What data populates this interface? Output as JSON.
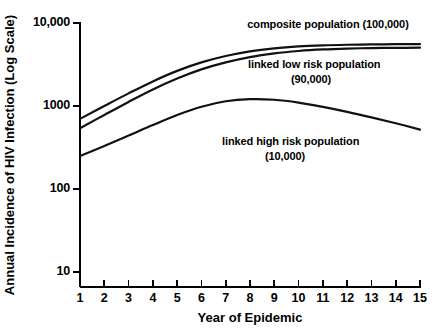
{
  "chart_data": {
    "type": "line",
    "title": "",
    "xlabel": "Year of Epidemic",
    "ylabel": "Annual Incidence of HIV Infection (Log Scale)",
    "xlim": [
      1,
      15
    ],
    "ylim": [
      10,
      10000
    ],
    "yscale": "log",
    "grid": false,
    "legend": "inline-annotations",
    "xticks": [
      "1",
      "2",
      "3",
      "4",
      "5",
      "6",
      "7",
      "8",
      "9",
      "10",
      "11",
      "12",
      "13",
      "14",
      "15"
    ],
    "yticks": [
      "10",
      "100",
      "1000",
      "10,000"
    ],
    "x": [
      1,
      2,
      3,
      4,
      5,
      6,
      7,
      8,
      9,
      10,
      11,
      12,
      13,
      14,
      15
    ],
    "series": [
      {
        "name": "composite population (100,000)",
        "population": "100,000",
        "values": [
          700,
          1000,
          1420,
          1980,
          2650,
          3350,
          4000,
          4550,
          4950,
          5220,
          5380,
          5470,
          5520,
          5550,
          5560
        ]
      },
      {
        "name": "linked low risk population (90,000)",
        "population": "90,000",
        "values": [
          540,
          780,
          1120,
          1580,
          2140,
          2760,
          3350,
          3880,
          4300,
          4600,
          4800,
          4920,
          4990,
          5020,
          5040
        ]
      },
      {
        "name": "linked high risk population (10,000)",
        "population": "10,000",
        "values": [
          250,
          330,
          440,
          590,
          780,
          980,
          1140,
          1210,
          1190,
          1100,
          975,
          850,
          730,
          620,
          520
        ]
      }
    ]
  },
  "annotations": [
    {
      "id": "composite",
      "line1": "composite population (100,000)",
      "line2": ""
    },
    {
      "id": "low-risk",
      "line1": "linked low risk population",
      "line2": "(90,000)"
    },
    {
      "id": "high-risk",
      "line1": "linked high risk population",
      "line2": "(10,000)"
    }
  ],
  "axes": {
    "x_title": "Year of Epidemic",
    "y_title": "Annual Incidence of HIV Infection (Log Scale)"
  },
  "colors": {
    "background": "#ffffff",
    "axis": "#000000",
    "curve": "#111111"
  }
}
